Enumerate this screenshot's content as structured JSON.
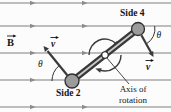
{
  "labels": {
    "side4": "Side 4",
    "side2": "Side 2",
    "axis_of_rotation": "Axis of rotation",
    "field_symbol": "B",
    "velocity_symbol": "v",
    "angle_symbol": "θ"
  },
  "colors": {
    "background": "#fcfcfc",
    "field_line": "#a9a9a9",
    "field_arrow": "#8c8c8c",
    "rod_dark": "#383838",
    "rod_highlight": "#c9c9c9",
    "terminal_fill": "#9b9b9b",
    "terminal_stroke": "#2f2f2f",
    "vector": "#3a3a3a",
    "text": "#141414"
  },
  "icons": {
    "field_direction": "right-arrowhead",
    "rotation_direction": "clockwise-curved-arrow",
    "vector_overhead": "right-arrow"
  }
}
